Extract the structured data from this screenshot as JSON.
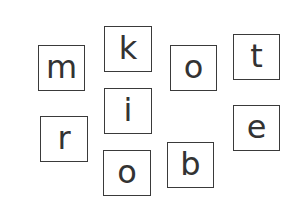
{
  "worksheet": {
    "tiles": [
      {
        "letter": "m",
        "x": 38,
        "y": 45,
        "w": 47,
        "h": 46
      },
      {
        "letter": "k",
        "x": 104,
        "y": 26,
        "w": 48,
        "h": 46
      },
      {
        "letter": "o",
        "x": 170,
        "y": 45,
        "w": 47,
        "h": 46
      },
      {
        "letter": "t",
        "x": 233,
        "y": 34,
        "w": 47,
        "h": 46
      },
      {
        "letter": "i",
        "x": 104,
        "y": 88,
        "w": 48,
        "h": 46
      },
      {
        "letter": "r",
        "x": 40,
        "y": 116,
        "w": 48,
        "h": 46
      },
      {
        "letter": "e",
        "x": 233,
        "y": 105,
        "w": 47,
        "h": 46
      },
      {
        "letter": "o",
        "x": 103,
        "y": 150,
        "w": 48,
        "h": 46
      },
      {
        "letter": "b",
        "x": 167,
        "y": 142,
        "w": 47,
        "h": 46
      }
    ],
    "colors": {
      "border": "#3a3a3a",
      "text": "#333333",
      "background": "#ffffff"
    }
  }
}
